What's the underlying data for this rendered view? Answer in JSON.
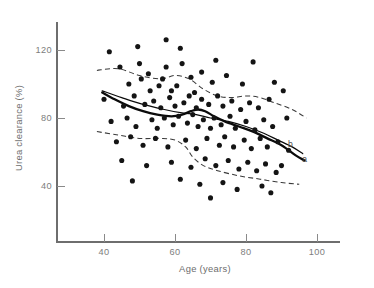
{
  "chart_data": {
    "type": "scatter",
    "title": "",
    "xlabel": "Age (years)",
    "ylabel": "Urea clearance (%)",
    "xlim": [
      26,
      108
    ],
    "ylim": [
      20,
      134
    ],
    "xticks": [
      40,
      60,
      80,
      100
    ],
    "yticks": [
      40,
      80,
      120
    ],
    "xtick_labels": [
      "40",
      "60",
      "80",
      "100"
    ],
    "ytick_labels": [
      "40",
      "80",
      "120"
    ],
    "grid": false,
    "legend_position": "inline-curve-labels",
    "annotations": [
      {
        "text": "b",
        "x": 92.5,
        "y": 63,
        "name": "curve-label-b"
      },
      {
        "text": "a",
        "x": 96.5,
        "y": 54,
        "name": "curve-label-a"
      }
    ],
    "series": [
      {
        "name": "observations",
        "type": "scatter",
        "marker": "filled-circle",
        "color": "#141414",
        "points": [
          [
            41.5,
            119
          ],
          [
            49.5,
            122
          ],
          [
            57.5,
            126
          ],
          [
            61.5,
            121
          ],
          [
            44.5,
            110
          ],
          [
            50.0,
            112
          ],
          [
            52.5,
            106
          ],
          [
            57.5,
            110
          ],
          [
            62.0,
            112
          ],
          [
            67.5,
            107
          ],
          [
            71.5,
            114
          ],
          [
            82.0,
            113
          ],
          [
            47.0,
            100
          ],
          [
            50.5,
            103
          ],
          [
            53.0,
            96
          ],
          [
            55.5,
            99
          ],
          [
            56.5,
            103
          ],
          [
            59.0,
            96
          ],
          [
            60.5,
            99
          ],
          [
            64.5,
            104
          ],
          [
            65.5,
            95
          ],
          [
            70.5,
            101
          ],
          [
            74.5,
            105
          ],
          [
            79.0,
            100
          ],
          [
            88.0,
            101
          ],
          [
            90.5,
            96
          ],
          [
            40.0,
            91
          ],
          [
            45.5,
            87
          ],
          [
            48.5,
            93
          ],
          [
            51.5,
            88
          ],
          [
            54.0,
            90
          ],
          [
            56.0,
            86
          ],
          [
            58.5,
            92
          ],
          [
            60.0,
            87
          ],
          [
            62.5,
            89
          ],
          [
            64.0,
            93
          ],
          [
            66.0,
            86
          ],
          [
            67.5,
            91
          ],
          [
            69.5,
            88
          ],
          [
            72.0,
            93
          ],
          [
            73.5,
            87
          ],
          [
            76.0,
            90
          ],
          [
            78.5,
            85
          ],
          [
            81.0,
            89
          ],
          [
            83.5,
            86
          ],
          [
            86.5,
            91
          ],
          [
            42.0,
            78
          ],
          [
            46.5,
            80
          ],
          [
            49.0,
            75
          ],
          [
            53.5,
            79
          ],
          [
            55.0,
            74
          ],
          [
            57.0,
            80
          ],
          [
            59.5,
            76
          ],
          [
            61.0,
            81
          ],
          [
            63.5,
            77
          ],
          [
            65.0,
            82
          ],
          [
            66.5,
            75
          ],
          [
            68.0,
            79
          ],
          [
            70.0,
            74
          ],
          [
            71.0,
            80
          ],
          [
            73.0,
            76
          ],
          [
            75.5,
            81
          ],
          [
            77.0,
            74
          ],
          [
            80.0,
            78
          ],
          [
            82.5,
            73
          ],
          [
            85.0,
            79
          ],
          [
            87.5,
            75
          ],
          [
            91.5,
            80
          ],
          [
            43.5,
            66
          ],
          [
            47.5,
            69
          ],
          [
            51.0,
            64
          ],
          [
            54.5,
            68
          ],
          [
            58.0,
            63
          ],
          [
            63.0,
            67
          ],
          [
            66.0,
            62
          ],
          [
            69.0,
            68
          ],
          [
            72.5,
            64
          ],
          [
            74.0,
            69
          ],
          [
            76.5,
            63
          ],
          [
            79.5,
            67
          ],
          [
            81.5,
            62
          ],
          [
            84.0,
            68
          ],
          [
            86.0,
            63
          ],
          [
            89.0,
            66
          ],
          [
            92.0,
            61
          ],
          [
            45.0,
            55
          ],
          [
            52.0,
            52
          ],
          [
            59.0,
            54
          ],
          [
            64.5,
            51
          ],
          [
            68.5,
            56
          ],
          [
            71.5,
            52
          ],
          [
            75.0,
            55
          ],
          [
            78.0,
            50
          ],
          [
            80.5,
            54
          ],
          [
            83.0,
            49
          ],
          [
            85.5,
            53
          ],
          [
            88.5,
            48
          ],
          [
            90.0,
            52
          ],
          [
            48.0,
            43
          ],
          [
            61.5,
            44
          ],
          [
            67.0,
            41
          ],
          [
            73.5,
            42
          ],
          [
            77.5,
            38
          ],
          [
            84.5,
            40
          ],
          [
            87.0,
            36
          ],
          [
            70.0,
            33
          ]
        ]
      },
      {
        "name": "upper-confidence-band",
        "type": "line",
        "style": "dashed",
        "color": "#3a3a3a",
        "points": [
          [
            38.0,
            108
          ],
          [
            44.0,
            109
          ],
          [
            50.0,
            105
          ],
          [
            56.0,
            103
          ],
          [
            60.0,
            105
          ],
          [
            64.0,
            103
          ],
          [
            68.0,
            97
          ],
          [
            72.0,
            93
          ],
          [
            76.0,
            92
          ],
          [
            80.0,
            93
          ],
          [
            84.0,
            92
          ],
          [
            88.0,
            89
          ],
          [
            93.0,
            85
          ],
          [
            97.0,
            80
          ]
        ]
      },
      {
        "name": "lower-confidence-band",
        "type": "line",
        "style": "dashed",
        "color": "#3a3a3a",
        "points": [
          [
            38.0,
            72
          ],
          [
            44.0,
            70
          ],
          [
            50.0,
            68
          ],
          [
            56.0,
            68
          ],
          [
            60.0,
            67
          ],
          [
            63.0,
            63
          ],
          [
            65.0,
            57
          ],
          [
            68.0,
            52
          ],
          [
            72.0,
            49
          ],
          [
            78.0,
            46
          ],
          [
            84.0,
            44
          ],
          [
            90.0,
            42
          ],
          [
            95.0,
            41
          ]
        ]
      },
      {
        "name": "fitted-curve-a",
        "type": "line",
        "style": "solid-thick",
        "color": "#0b0b0b",
        "points": [
          [
            39.5,
            95
          ],
          [
            43.0,
            91
          ],
          [
            47.0,
            87
          ],
          [
            51.0,
            84
          ],
          [
            55.0,
            82
          ],
          [
            59.0,
            81
          ],
          [
            62.0,
            82
          ],
          [
            64.5,
            84
          ],
          [
            66.5,
            85
          ],
          [
            68.5,
            84
          ],
          [
            71.0,
            81
          ],
          [
            74.0,
            78
          ],
          [
            78.0,
            75
          ],
          [
            82.0,
            72
          ],
          [
            86.0,
            68
          ],
          [
            90.0,
            64
          ],
          [
            94.0,
            58
          ],
          [
            96.5,
            55
          ]
        ]
      },
      {
        "name": "fitted-curve-b",
        "type": "line",
        "style": "solid-thin",
        "color": "#0b0b0b",
        "points": [
          [
            39.5,
            96
          ],
          [
            45.0,
            92
          ],
          [
            51.0,
            88
          ],
          [
            57.0,
            85
          ],
          [
            62.0,
            83
          ],
          [
            66.0,
            82
          ],
          [
            70.0,
            80
          ],
          [
            75.0,
            78
          ],
          [
            80.0,
            75
          ],
          [
            85.0,
            71
          ],
          [
            89.0,
            67
          ],
          [
            93.0,
            63
          ],
          [
            96.0,
            59
          ]
        ]
      }
    ]
  }
}
